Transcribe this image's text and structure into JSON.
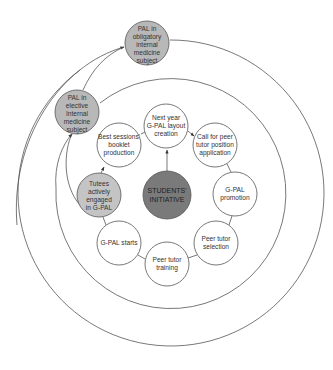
{
  "colors": {
    "stroke": "#555555",
    "node_white": "#ffffff",
    "node_light_gray": "#c4c4c4",
    "node_mid_gray": "#b8b8b8",
    "node_dark_gray": "#7a7a7a"
  },
  "rings": [
    {
      "name": "outer-ring",
      "cx": 167,
      "cy": 197,
      "r": 153
    },
    {
      "name": "middle-ring",
      "cx": 168,
      "cy": 198,
      "r": 115
    }
  ],
  "center_node": {
    "lines": [
      "STUDENTS'",
      "INITIATIVE"
    ],
    "cx": 167,
    "cy": 195,
    "r": 24
  },
  "cycle_nodes": [
    {
      "id": "next-year",
      "lines": [
        "Next year",
        "G-PAL layout",
        "creation"
      ],
      "cx": 166,
      "cy": 126
    },
    {
      "id": "call-peer",
      "lines": [
        "Call for peer",
        "tutor position",
        "application"
      ],
      "cx": 215,
      "cy": 145
    },
    {
      "id": "gpal-promotion",
      "lines": [
        "G-PAL",
        "promotion"
      ],
      "cx": 235,
      "cy": 194
    },
    {
      "id": "peer-selection",
      "lines": [
        "Peer tutor",
        "selection"
      ],
      "cx": 216,
      "cy": 243
    },
    {
      "id": "peer-training",
      "lines": [
        "Peer tutor",
        "training"
      ],
      "cx": 167,
      "cy": 264
    },
    {
      "id": "gpal-starts",
      "lines": [
        "G-PAL starts"
      ],
      "cx": 119,
      "cy": 243
    },
    {
      "id": "tutees-engaged",
      "lines": [
        "Tutees",
        "actively",
        "engaged",
        "in G-PAL"
      ],
      "cx": 99,
      "cy": 195,
      "fill": "light"
    },
    {
      "id": "best-sessions",
      "lines": [
        "Best sessions'",
        "booklet",
        "production"
      ],
      "cx": 119,
      "cy": 145
    }
  ],
  "outer_nodes": [
    {
      "id": "pal-elective",
      "lines": [
        "PAL in",
        "elective",
        "Internal",
        "medicine",
        "subject"
      ],
      "cx": 77,
      "cy": 112
    },
    {
      "id": "pal-obligatory",
      "lines": [
        "PAL in",
        "obligatory",
        "internal",
        "medicine",
        "subject"
      ],
      "cx": 147,
      "cy": 43
    }
  ]
}
